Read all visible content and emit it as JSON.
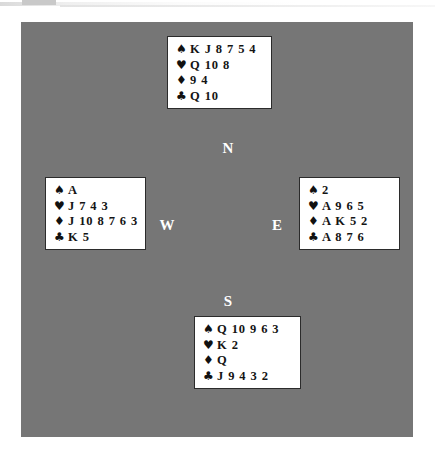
{
  "suit_symbols": {
    "spade": "♠",
    "heart": "♥",
    "diamond": "♦",
    "club": "♣"
  },
  "colors": {
    "panel_background": "#767676",
    "hand_box_background": "#ffffff",
    "hand_box_border": "#2b2b2b",
    "card_text": "#141414",
    "compass_label": "#ffffff"
  },
  "compass": {
    "north": "N",
    "west": "W",
    "east": "E",
    "south": "S"
  },
  "hands": {
    "north": {
      "position_label": "N",
      "spades": "K J 8 7 5 4",
      "hearts": "Q 10 8",
      "diamonds": "9 4",
      "clubs": "Q 10"
    },
    "west": {
      "position_label": "W",
      "spades": "A",
      "hearts": "J 7 4 3",
      "diamonds": "J 10 8 7 6 3",
      "clubs": "K 5"
    },
    "east": {
      "position_label": "E",
      "spades": "2",
      "hearts": "A 9 6 5",
      "diamonds": "A K 5 2",
      "clubs": "A 8 7 6"
    },
    "south": {
      "position_label": "S",
      "spades": "Q 10 9 6 3",
      "hearts": "K 2",
      "diamonds": "Q",
      "clubs": "J 9 4 3 2"
    }
  }
}
